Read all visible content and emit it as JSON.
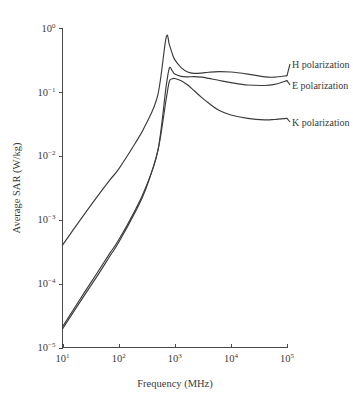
{
  "chart_data": {
    "type": "line",
    "title": "",
    "xlabel": "Frequency (MHz)",
    "ylabel": "Average SAR (W/kg)",
    "xscale": "log",
    "yscale": "log",
    "xlim": [
      10,
      100000
    ],
    "ylim": [
      1e-05,
      1
    ],
    "grid": false,
    "legend_position": "right-inline-annotations",
    "xticks": [
      {
        "value": 10,
        "label": "10",
        "exponent": "1"
      },
      {
        "value": 100,
        "label": "10",
        "exponent": "2"
      },
      {
        "value": 1000,
        "label": "10",
        "exponent": "3"
      },
      {
        "value": 10000,
        "label": "10",
        "exponent": "4"
      },
      {
        "value": 100000,
        "label": "10",
        "exponent": "5"
      }
    ],
    "yticks": [
      {
        "value": 1,
        "label": "10",
        "exponent": "0"
      },
      {
        "value": 0.1,
        "label": "10",
        "exponent": "−1"
      },
      {
        "value": 0.01,
        "label": "10",
        "exponent": "−2"
      },
      {
        "value": 0.001,
        "label": "10",
        "exponent": "−3"
      },
      {
        "value": 0.0001,
        "label": "10",
        "exponent": "−4"
      },
      {
        "value": 1e-05,
        "label": "10",
        "exponent": "−5"
      }
    ],
    "series": [
      {
        "name": "H polarization",
        "label": "H polarization",
        "x": [
          10,
          20,
          40,
          70,
          100,
          200,
          300,
          500,
          700,
          800,
          900,
          1000,
          1300,
          1700,
          2200,
          3000,
          4000,
          6000,
          10000,
          20000,
          40000,
          60000,
          100000
        ],
        "y": [
          0.0004,
          0.00095,
          0.0022,
          0.0042,
          0.0062,
          0.016,
          0.03,
          0.09,
          0.7,
          0.55,
          0.4,
          0.32,
          0.24,
          0.205,
          0.195,
          0.197,
          0.203,
          0.208,
          0.205,
          0.19,
          0.172,
          0.17,
          0.18
        ]
      },
      {
        "name": "E polarization",
        "label": "E polarization",
        "x": [
          10,
          20,
          40,
          70,
          100,
          200,
          300,
          500,
          700,
          800,
          900,
          1000,
          1300,
          1700,
          2200,
          3000,
          4000,
          6000,
          10000,
          20000,
          40000,
          60000,
          100000
        ],
        "y": [
          2.1e-05,
          5.5e-05,
          0.00014,
          0.0003,
          0.00048,
          0.00145,
          0.0031,
          0.012,
          0.12,
          0.235,
          0.215,
          0.19,
          0.175,
          0.172,
          0.173,
          0.17,
          0.163,
          0.152,
          0.14,
          0.128,
          0.126,
          0.131,
          0.15
        ]
      },
      {
        "name": "K polarization",
        "label": "K polarization",
        "x": [
          10,
          20,
          40,
          70,
          100,
          200,
          300,
          500,
          700,
          800,
          900,
          1000,
          1300,
          1700,
          2200,
          3000,
          4000,
          6000,
          10000,
          20000,
          40000,
          60000,
          100000
        ],
        "y": [
          1.95e-05,
          5e-05,
          0.000125,
          0.00027,
          0.00044,
          0.00135,
          0.0029,
          0.012,
          0.075,
          0.145,
          0.16,
          0.162,
          0.15,
          0.128,
          0.105,
          0.082,
          0.067,
          0.052,
          0.0435,
          0.0385,
          0.0365,
          0.037,
          0.0385
        ]
      }
    ],
    "annotations": [
      {
        "text": "H polarization",
        "anchor_x": 100000,
        "anchor_y": 0.18
      },
      {
        "text": "E polarization",
        "anchor_x": 100000,
        "anchor_y": 0.15
      },
      {
        "text": "K polarization",
        "anchor_x": 100000,
        "anchor_y": 0.0385
      }
    ]
  }
}
